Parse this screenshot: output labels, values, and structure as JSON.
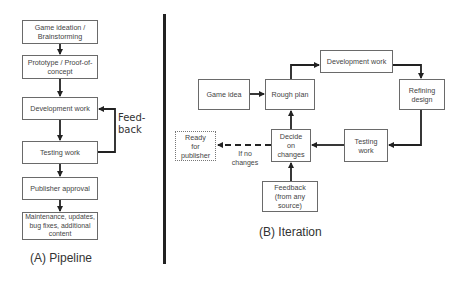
{
  "pipeline": {
    "caption": "(A) Pipeline",
    "steps": [
      {
        "label": "Game ideation / Brainstorming"
      },
      {
        "label": "Prototype / Proof-of-concept"
      },
      {
        "label": "Development work"
      },
      {
        "label": "Testing work"
      },
      {
        "label": "Publisher approval"
      },
      {
        "label": "Maintenance, updates, bug fixes, additional content"
      }
    ],
    "feedback_label": "Feed-back"
  },
  "iteration": {
    "caption": "(B) Iteration",
    "nodes": {
      "game_idea": "Game idea",
      "rough_plan": "Rough plan",
      "development_work": "Development work",
      "refining_design": "Refining design",
      "testing_work": "Testing work",
      "decide_on_changes": "Decide on changes",
      "ready_for_publisher": "Ready for publisher",
      "feedback": "Feedback (from any source)"
    },
    "edge_labels": {
      "if_no_changes": "If no changes"
    }
  },
  "colors": {
    "box_border": "#6a6a6a",
    "arrow": "#222222",
    "divider": "#222222"
  }
}
